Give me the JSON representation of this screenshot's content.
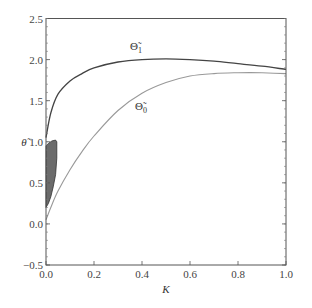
{
  "chart_data": {
    "type": "line",
    "title": "",
    "xlabel": "K",
    "ylabel": "θ̃",
    "xlim": [
      0.0,
      1.0
    ],
    "ylim": [
      -0.5,
      2.5
    ],
    "grid": false,
    "legend": "inline curve labels",
    "x_ticks": [
      "0.0",
      "0.2",
      "0.4",
      "0.6",
      "0.8",
      "1.0"
    ],
    "y_ticks": [
      "-0.5",
      "0.0",
      "0.5",
      "1.0",
      "1.5",
      "2.0",
      "2.5"
    ],
    "series": [
      {
        "name": "Θ̃1",
        "label_main": "Θ̃",
        "label_sub": "1",
        "color": "#444444",
        "x": [
          0.0,
          0.02,
          0.05,
          0.1,
          0.15,
          0.2,
          0.3,
          0.4,
          0.5,
          0.6,
          0.7,
          0.8,
          0.9,
          1.0
        ],
        "y": [
          1.05,
          1.35,
          1.58,
          1.74,
          1.83,
          1.9,
          1.97,
          2.0,
          2.01,
          2.0,
          1.98,
          1.95,
          1.92,
          1.88
        ]
      },
      {
        "name": "Θ̃0",
        "label_main": "Θ̃",
        "label_sub": "0",
        "color": "#999999",
        "x": [
          0.0,
          0.02,
          0.05,
          0.1,
          0.15,
          0.2,
          0.3,
          0.4,
          0.5,
          0.6,
          0.7,
          0.8,
          0.9,
          1.0
        ],
        "y": [
          0.05,
          0.2,
          0.4,
          0.66,
          0.88,
          1.07,
          1.38,
          1.59,
          1.72,
          1.8,
          1.83,
          1.84,
          1.84,
          1.83
        ]
      }
    ],
    "shaded_region": {
      "color": "#6b6b6b",
      "description": "filled region near K=0 between θ≈0.2 and θ≈1.02",
      "boundary_x": [
        0.0,
        0.0,
        0.01,
        0.025,
        0.04,
        0.045,
        0.045,
        0.04,
        0.03,
        0.02,
        0.01,
        0.0
      ],
      "boundary_y": [
        0.2,
        0.95,
        0.98,
        1.01,
        1.02,
        1.0,
        0.8,
        0.6,
        0.45,
        0.33,
        0.25,
        0.2
      ]
    }
  }
}
